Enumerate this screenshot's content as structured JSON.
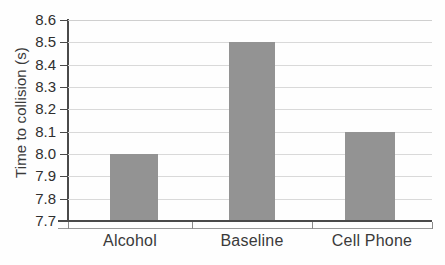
{
  "chart_data": {
    "type": "bar",
    "title": "",
    "xlabel": "",
    "ylabel": "Time to collision (s)",
    "categories": [
      "Alcohol",
      "Baseline",
      "Cell Phone"
    ],
    "values": [
      8.0,
      8.5,
      8.1
    ],
    "ylim": [
      7.7,
      8.6
    ],
    "ytick_step": 0.1,
    "ytick_labels": [
      "8.6",
      "8.5",
      "8.4",
      "8.3",
      "8.2",
      "8.1",
      "8.0",
      "7.9",
      "7.8",
      "7.7"
    ],
    "ytick_values": [
      8.6,
      8.5,
      8.4,
      8.3,
      8.2,
      8.1,
      8.0,
      7.9,
      7.8,
      7.7
    ],
    "grid": true,
    "legend": false,
    "series": [
      {
        "name": "Time to collision",
        "values": [
          8.0,
          8.5,
          8.1
        ]
      }
    ],
    "bar_color": "#939393",
    "axis_color": "#4a4a4a",
    "grid_color": "#d9d9d9",
    "text_color": "#3a3a3a",
    "background_color": "#fefefe"
  }
}
